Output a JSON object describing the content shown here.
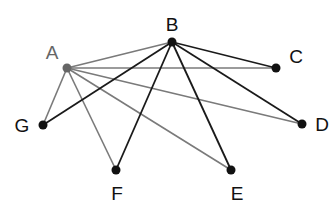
{
  "diagram": {
    "type": "graph",
    "nodes": [
      {
        "id": "A",
        "label": "A",
        "x": 67,
        "y": 68,
        "lx": 52,
        "ly": 52,
        "color": "#666666",
        "r": 4.5
      },
      {
        "id": "B",
        "label": "B",
        "x": 172,
        "y": 42,
        "lx": 172,
        "ly": 24,
        "color": "#111111",
        "r": 4.5
      },
      {
        "id": "C",
        "label": "C",
        "x": 276,
        "y": 68,
        "lx": 296,
        "ly": 56,
        "color": "#111111",
        "r": 4.5
      },
      {
        "id": "D",
        "label": "D",
        "x": 302,
        "y": 124,
        "lx": 322,
        "ly": 124,
        "color": "#111111",
        "r": 4.5
      },
      {
        "id": "E",
        "label": "E",
        "x": 231,
        "y": 170,
        "lx": 237,
        "ly": 193,
        "color": "#111111",
        "r": 4.5
      },
      {
        "id": "F",
        "label": "F",
        "x": 116,
        "y": 170,
        "lx": 117,
        "ly": 193,
        "color": "#111111",
        "r": 4.5
      },
      {
        "id": "G",
        "label": "G",
        "x": 43,
        "y": 125,
        "lx": 22,
        "ly": 125,
        "color": "#111111",
        "r": 4.5
      }
    ],
    "edges": [
      {
        "from": "A",
        "to": "B",
        "color": "#7a7a7a",
        "width": 1.6
      },
      {
        "from": "A",
        "to": "C",
        "color": "#7a7a7a",
        "width": 1.6
      },
      {
        "from": "A",
        "to": "D",
        "color": "#7a7a7a",
        "width": 1.6
      },
      {
        "from": "A",
        "to": "E",
        "color": "#7a7a7a",
        "width": 1.6
      },
      {
        "from": "A",
        "to": "F",
        "color": "#7a7a7a",
        "width": 1.6
      },
      {
        "from": "A",
        "to": "G",
        "color": "#7a7a7a",
        "width": 1.6
      },
      {
        "from": "B",
        "to": "C",
        "color": "#1a1a1a",
        "width": 1.8
      },
      {
        "from": "B",
        "to": "D",
        "color": "#1a1a1a",
        "width": 1.8
      },
      {
        "from": "B",
        "to": "E",
        "color": "#1a1a1a",
        "width": 1.8
      },
      {
        "from": "B",
        "to": "F",
        "color": "#1a1a1a",
        "width": 1.8
      },
      {
        "from": "B",
        "to": "G",
        "color": "#1a1a1a",
        "width": 1.8
      }
    ]
  }
}
